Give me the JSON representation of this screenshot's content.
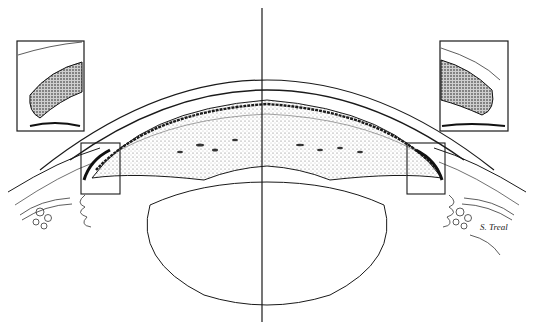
{
  "figure": {
    "type": "anatomical illustration",
    "signature": "S. Treal",
    "colors": {
      "ink": "#1a1a1a",
      "stipple": "#7a7a7a",
      "background": "#ffffff"
    },
    "insets": [
      {
        "position": "top-left",
        "detail_of": "left iridocorneal angle"
      },
      {
        "position": "top-right",
        "detail_of": "right iridocorneal angle"
      }
    ],
    "highlight_boxes": [
      {
        "position": "left angle"
      },
      {
        "position": "right angle"
      }
    ],
    "divider": "vertical midline"
  }
}
